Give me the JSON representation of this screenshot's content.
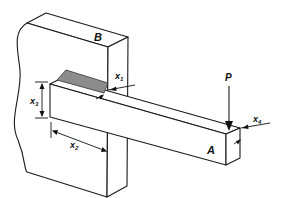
{
  "figure": {
    "labels": {
      "wall": "B",
      "beam": "A",
      "load": "P",
      "x1": "x",
      "x1_sub": "1",
      "x2": "x",
      "x2_sub": "2",
      "x3": "x",
      "x3_sub": "3",
      "x4": "x",
      "x4_sub": "4"
    },
    "colors": {
      "line": "#1a1a1a",
      "weld_fill": "#8c8c8c",
      "background": "#ffffff"
    }
  }
}
